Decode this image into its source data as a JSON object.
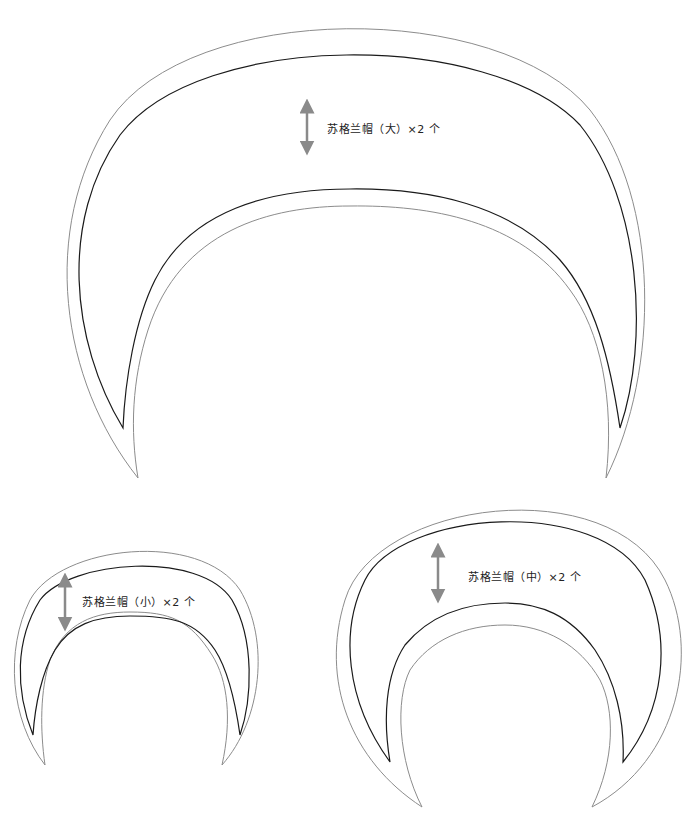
{
  "pieces": [
    {
      "id": "large",
      "label": "苏格兰帽（大）×2 个",
      "size": "大",
      "quantity": "×2 个"
    },
    {
      "id": "small",
      "label": "苏格兰帽（小）×2 个",
      "size": "小",
      "quantity": "×2 个"
    },
    {
      "id": "medium",
      "label": "苏格兰帽（中）×2 个",
      "size": "中",
      "quantity": "×2 个"
    }
  ],
  "colors": {
    "cut_line": "#1a1a1a",
    "seam_allowance_line": "#8c8c8c",
    "arrow": "#8a8a8a",
    "background": "#ffffff"
  }
}
